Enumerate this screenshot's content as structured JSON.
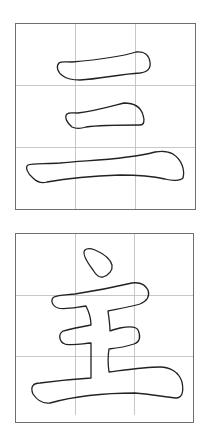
{
  "cards": [
    {
      "character": "三",
      "grid": "3x3 guide grid",
      "strokes": [
        "stroke-1-horizontal-top",
        "stroke-2-horizontal-middle",
        "stroke-3-horizontal-bottom"
      ]
    },
    {
      "character": "主",
      "grid": "3x3 guide grid",
      "strokes": [
        "stroke-1-dot",
        "stroke-2-body-outline"
      ]
    }
  ],
  "colors": {
    "border": "#6e6e6e",
    "grid": "#b9b9b9",
    "outline": "#222222",
    "background": "#ffffff"
  }
}
